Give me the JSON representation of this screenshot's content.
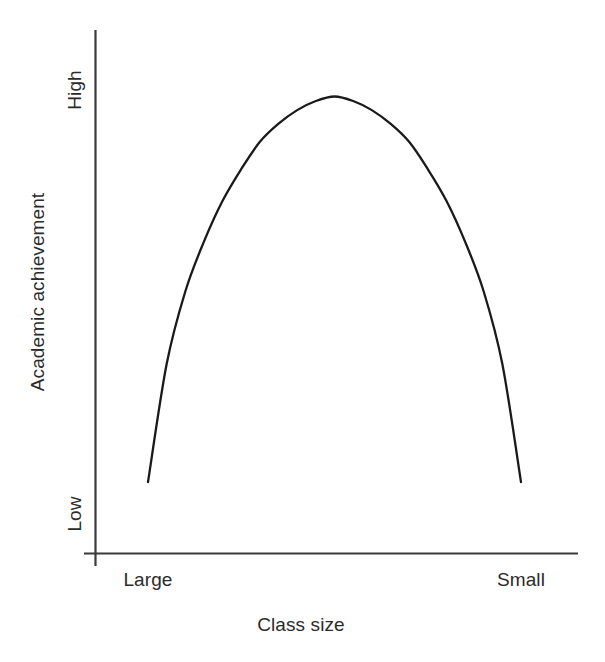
{
  "chart_data": {
    "type": "line",
    "title": "",
    "subtitle": "",
    "xlabel": "Class size",
    "ylabel": "Academic achievement",
    "xtick_labels": [
      "Large",
      "Small"
    ],
    "ytick_labels": [
      "Low",
      "High"
    ],
    "grid": false,
    "legend": null,
    "annotations": [],
    "axis_color": "#3a3a3a",
    "curve_color": "#1a1a1a",
    "text_color": "#2b2b2b",
    "xlim": [
      0,
      1
    ],
    "ylim": [
      0,
      1
    ],
    "series": [
      {
        "name": "Academic achievement vs class size",
        "shape": "inverted-u",
        "description": "Concave-down curve rising from low achievement at large class sizes to a peak at intermediate class size, then falling back to low achievement at small class sizes",
        "x": [
          0.0,
          0.05,
          0.1,
          0.15,
          0.2,
          0.25,
          0.3,
          0.35,
          0.4,
          0.45,
          0.5,
          0.55,
          0.6,
          0.65,
          0.7,
          0.75,
          0.8,
          0.85,
          0.9,
          0.95,
          1.0
        ],
        "y": [
          0.13,
          0.39,
          0.55,
          0.66,
          0.75,
          0.82,
          0.88,
          0.92,
          0.95,
          0.97,
          0.98,
          0.97,
          0.95,
          0.92,
          0.88,
          0.82,
          0.75,
          0.66,
          0.55,
          0.39,
          0.13
        ],
        "peak": {
          "x": 0.5,
          "y": 0.98
        },
        "endpoints": {
          "left": {
            "x": 0.0,
            "y": 0.13
          },
          "right": {
            "x": 1.0,
            "y": 0.13
          }
        }
      }
    ]
  },
  "axes": {
    "y_axis_title": "Academic achievement",
    "y_tick_high": "High",
    "y_tick_low": "Low",
    "x_axis_title": "Class size",
    "x_tick_left": "Large",
    "x_tick_right": "Small"
  }
}
